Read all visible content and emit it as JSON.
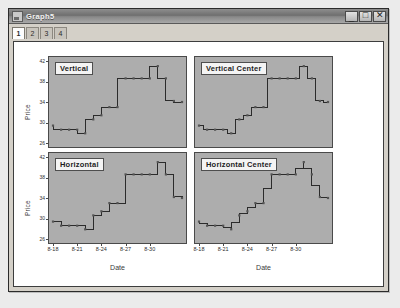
{
  "window": {
    "title": "Graph5",
    "icon": "chart-document-icon",
    "controls": [
      {
        "name": "minimize",
        "glyph": "_"
      },
      {
        "name": "maximize",
        "glyph": "□"
      },
      {
        "name": "close",
        "glyph": "✕"
      }
    ]
  },
  "tabs": {
    "items": [
      {
        "label": "1",
        "active": true
      },
      {
        "label": "2",
        "active": false
      },
      {
        "label": "3",
        "active": false
      },
      {
        "label": "4",
        "active": false
      }
    ]
  },
  "chart_data": [
    {
      "id": "vertical",
      "type": "line",
      "step": "vertical",
      "title": "Vertical",
      "xlabel": "Date",
      "ylabel": "Price",
      "grid": false,
      "ylim": [
        26,
        42
      ],
      "yticks": [
        26,
        30,
        34,
        38,
        42
      ],
      "ytick_labels": [
        "26",
        "30",
        "34",
        "38",
        "42"
      ],
      "xticks": [
        "8-18",
        "8-21",
        "8-24",
        "8-27",
        "8-30"
      ],
      "x": [
        0,
        1,
        2,
        3,
        4,
        5,
        6,
        7,
        8,
        9,
        10,
        11,
        12,
        13,
        14,
        15,
        16
      ],
      "values": [
        29.4,
        28.6,
        28.6,
        28.6,
        27.9,
        30.6,
        31.4,
        33.0,
        33.0,
        38.6,
        38.6,
        38.6,
        38.6,
        41.0,
        38.6,
        34.2,
        34.0
      ]
    },
    {
      "id": "vertical_center",
      "type": "line",
      "step": "vertical-center",
      "title": "Vertical Center",
      "xlabel": "Date",
      "ylabel": "",
      "grid": false,
      "ylim": [
        26,
        42
      ],
      "yticks": [
        26,
        30,
        34,
        38,
        42
      ],
      "ytick_labels": [
        "26",
        "30",
        "34",
        "38",
        "42"
      ],
      "xticks": [
        "8-18",
        "8-21",
        "8-24",
        "8-27",
        "8-30"
      ],
      "x": [
        0,
        1,
        2,
        3,
        4,
        5,
        6,
        7,
        8,
        9,
        10,
        11,
        12,
        13,
        14,
        15,
        16
      ],
      "values": [
        29.4,
        28.6,
        28.6,
        28.6,
        27.9,
        30.6,
        31.4,
        33.0,
        33.0,
        38.6,
        38.6,
        38.6,
        38.6,
        41.0,
        38.6,
        34.2,
        34.0
      ]
    },
    {
      "id": "horizontal",
      "type": "line",
      "step": "horizontal",
      "title": "Horizontal",
      "xlabel": "Date",
      "ylabel": "Price",
      "grid": false,
      "ylim": [
        26,
        42
      ],
      "yticks": [
        26,
        30,
        34,
        38,
        42
      ],
      "ytick_labels": [
        "26",
        "30",
        "34",
        "38",
        "42"
      ],
      "xticks": [
        "8-18",
        "8-21",
        "8-24",
        "8-27",
        "8-30"
      ],
      "x": [
        0,
        1,
        2,
        3,
        4,
        5,
        6,
        7,
        8,
        9,
        10,
        11,
        12,
        13,
        14,
        15,
        16
      ],
      "values": [
        29.4,
        28.6,
        28.6,
        28.6,
        27.9,
        30.6,
        31.4,
        33.0,
        33.0,
        38.6,
        38.6,
        38.6,
        38.6,
        41.0,
        38.6,
        34.2,
        34.0
      ]
    },
    {
      "id": "horizontal_center",
      "type": "line",
      "step": "horizontal-center",
      "title": "Horizontal Center",
      "xlabel": "Date",
      "ylabel": "",
      "grid": false,
      "ylim": [
        26,
        42
      ],
      "yticks": [
        26,
        30,
        34,
        38,
        42
      ],
      "ytick_labels": [
        "26",
        "30",
        "34",
        "38",
        "42"
      ],
      "xticks": [
        "8-18",
        "8-21",
        "8-24",
        "8-27",
        "8-30"
      ],
      "x": [
        0,
        1,
        2,
        3,
        4,
        5,
        6,
        7,
        8,
        9,
        10,
        11,
        12,
        13,
        14,
        15,
        16
      ],
      "values": [
        29.4,
        28.6,
        28.6,
        28.6,
        27.9,
        30.6,
        31.4,
        33.0,
        33.0,
        38.6,
        38.6,
        38.6,
        38.6,
        41.0,
        38.6,
        34.2,
        34.0
      ]
    }
  ],
  "colors": {
    "plot_background": "#adadad",
    "series_line": "#2b2b2b",
    "marker": "#555555",
    "axis": "#4a4a4a",
    "window_face": "#d4d0c8",
    "client_background": "#ffffff"
  }
}
